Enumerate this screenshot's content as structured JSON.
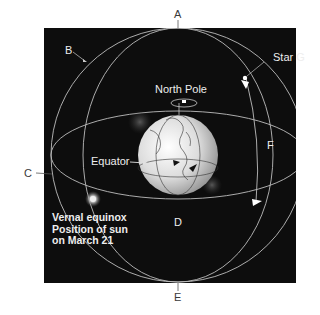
{
  "diagram": {
    "labels": {
      "a": "A",
      "b": "B",
      "c": "C",
      "d": "D",
      "e": "E",
      "f": "F",
      "star": "Star G",
      "north_pole": "North Pole",
      "equator": "Equator"
    },
    "vernal_equinox": {
      "line1": "Vernal equinox",
      "line2": "Position of sun",
      "line3": "on March 21"
    },
    "colors": {
      "background": "#0d0d0d",
      "lines": "#bdbdbd",
      "globe": "#e6e6e6",
      "label_outer": "#3a3a3a",
      "label_inner": "#eeeeee"
    }
  }
}
